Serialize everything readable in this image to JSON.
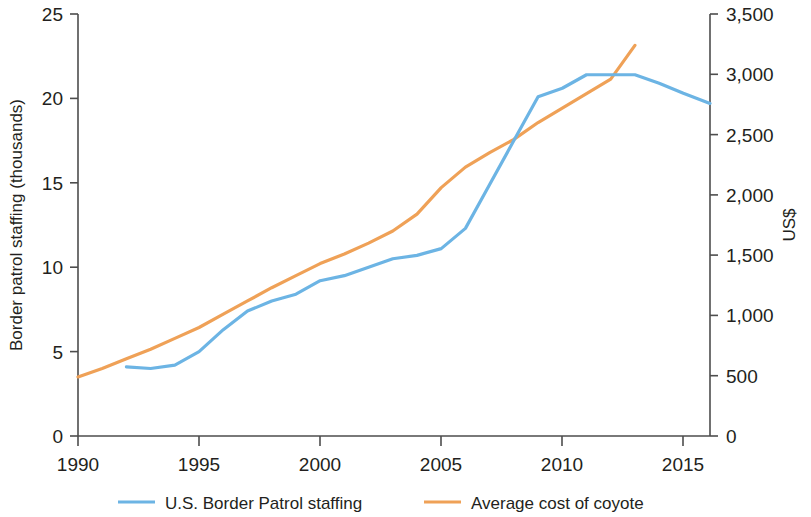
{
  "chart_data": {
    "type": "line",
    "title": "",
    "subtitle": "",
    "xlabel": "",
    "ylabel": "Border patrol staffing (thousands)",
    "y2label": "US$",
    "xlim": [
      1990,
      2016.1
    ],
    "ylim": [
      0,
      25
    ],
    "y2lim": [
      0,
      3500
    ],
    "grid": false,
    "legend_position": "bottom",
    "xticks": [
      1990,
      1995,
      2000,
      2005,
      2010,
      2015
    ],
    "xtick_labels": [
      "1990",
      "1995",
      "2000",
      "2005",
      "2010",
      "2015"
    ],
    "yticks": [
      0,
      5,
      10,
      15,
      20,
      25
    ],
    "ytick_labels": [
      "0",
      "5",
      "10",
      "15",
      "20",
      "25"
    ],
    "y2ticks": [
      0,
      500,
      1000,
      1500,
      2000,
      2500,
      3000,
      3500
    ],
    "y2tick_labels": [
      "0",
      "500",
      "1,000",
      "1,500",
      "2,000",
      "2,500",
      "3,000",
      "3,500"
    ],
    "series": [
      {
        "name": "U.S. Border Patrol staffing",
        "label": "U.S. Border Patrol staffing",
        "color": "#6CB4E4",
        "axis": "left",
        "units": "thousands",
        "x": [
          1992,
          1993,
          1994,
          1995,
          1996,
          1997,
          1998,
          1999,
          2000,
          2001,
          2002,
          2003,
          2004,
          2005,
          2006,
          2007,
          2008,
          2009,
          2010,
          2011,
          2012,
          2013,
          2014,
          2015,
          2016.1
        ],
        "values": [
          4.1,
          4.0,
          4.2,
          5.0,
          6.3,
          7.4,
          8.0,
          8.4,
          9.2,
          9.5,
          10.0,
          10.5,
          10.7,
          11.1,
          12.3,
          14.9,
          17.5,
          20.1,
          20.6,
          21.4,
          21.4,
          21.4,
          20.9,
          20.3,
          19.7
        ]
      },
      {
        "name": "Average cost of coyote",
        "label": "Average cost of coyote",
        "color": "#EFA157",
        "axis": "right",
        "units": "US$",
        "x": [
          1990,
          1991,
          1992,
          1993,
          1994,
          1995,
          1996,
          1997,
          1998,
          1999,
          2000,
          2001,
          2002,
          2003,
          2004,
          2005,
          2006,
          2007,
          2008,
          2009,
          2010,
          2011,
          2012,
          2013
        ],
        "values": [
          490,
          560,
          640,
          720,
          810,
          900,
          1010,
          1120,
          1230,
          1330,
          1430,
          1510,
          1600,
          1700,
          1840,
          2060,
          2230,
          2350,
          2460,
          2600,
          2720,
          2840,
          2960,
          3240
        ]
      }
    ]
  },
  "legend": {
    "items": [
      {
        "label": "U.S. Border Patrol staffing",
        "color": "#6CB4E4"
      },
      {
        "label": "Average cost of coyote",
        "color": "#EFA157"
      }
    ]
  }
}
